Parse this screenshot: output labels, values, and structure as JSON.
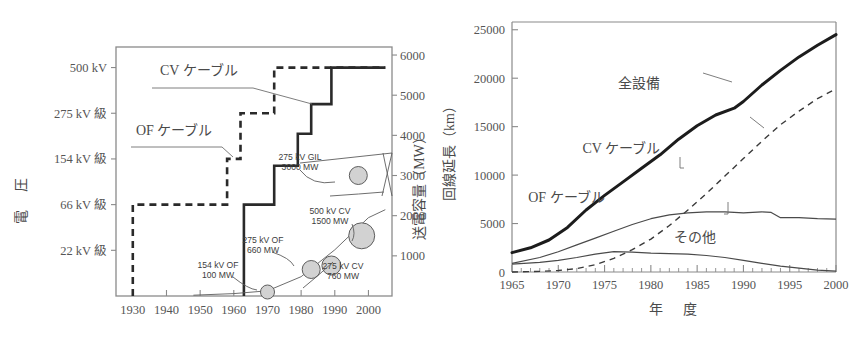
{
  "figure": {
    "background": "#ffffff",
    "ink": "#2a2a2a",
    "bubble_fill": "#d2d2d2",
    "bubble_stroke": "#5d5d5d",
    "caption_fragment": ""
  },
  "chart_data": [
    {
      "id": "left",
      "type": "line",
      "title": "",
      "xlabel": "",
      "ylabel": "電　圧",
      "y2label": "送電容量（MW）",
      "xlim": [
        1925,
        2007
      ],
      "xticks": [
        1930,
        1940,
        1950,
        1960,
        1970,
        1980,
        1990,
        2000
      ],
      "xticklabels": [
        "1930",
        "1940",
        "1950",
        "1960",
        "1970",
        "1980",
        "1990",
        "2000"
      ],
      "y_category_ticks": [
        {
          "label": "22 kV 級",
          "value": 1
        },
        {
          "label": "66 kV 級",
          "value": 2
        },
        {
          "label": "154 kV 級",
          "value": 3
        },
        {
          "label": "275 kV 級",
          "value": 4
        },
        {
          "label": "500 kV",
          "value": 5
        }
      ],
      "ylim": [
        0,
        5.45
      ],
      "y2ticks": [
        1000,
        2000,
        3000,
        4000,
        5000,
        6000
      ],
      "y2ticklabels": [
        "1000",
        "2000",
        "3000",
        "4000",
        "5000",
        "6000"
      ],
      "y2lim": [
        0,
        6200
      ],
      "grid": false,
      "series": [
        {
          "name": "OF ケーブル",
          "style": "dashed",
          "label_text": "OF ケーブル",
          "steps": [
            {
              "year": 1930,
              "level": 0
            },
            {
              "year": 1930,
              "level": 2
            },
            {
              "year": 1958,
              "level": 2
            },
            {
              "year": 1958,
              "level": 3
            },
            {
              "year": 1962,
              "level": 3
            },
            {
              "year": 1962,
              "level": 4
            },
            {
              "year": 1972,
              "level": 4
            },
            {
              "year": 1972,
              "level": 5
            },
            {
              "year": 2005,
              "level": 5
            }
          ]
        },
        {
          "name": "CV ケーブル",
          "style": "solid",
          "label_text": "CV ケーブル",
          "steps": [
            {
              "year": 1963,
              "level": 0
            },
            {
              "year": 1963,
              "level": 2
            },
            {
              "year": 1972,
              "level": 2
            },
            {
              "year": 1972,
              "level": 2.85
            },
            {
              "year": 1979,
              "level": 2.85
            },
            {
              "year": 1979,
              "level": 3.55
            },
            {
              "year": 1983,
              "level": 3.55
            },
            {
              "year": 1983,
              "level": 4.2
            },
            {
              "year": 1989,
              "level": 4.2
            },
            {
              "year": 1989,
              "level": 5
            },
            {
              "year": 2005,
              "level": 5
            }
          ]
        }
      ],
      "capacity_curve": [
        {
          "year": 1948,
          "mw": 20
        },
        {
          "year": 1960,
          "mw": 60
        },
        {
          "year": 1970,
          "mw": 130
        },
        {
          "year": 1980,
          "mw": 480
        },
        {
          "year": 1990,
          "mw": 1150
        },
        {
          "year": 2000,
          "mw": 1950
        },
        {
          "year": 2005,
          "mw": 2150
        }
      ],
      "bubbles": [
        {
          "label": "154 kV OF\n100 MW",
          "label_lines": [
            "154 kV OF",
            "100 MW"
          ],
          "year": 1970,
          "mw": 100,
          "r": 7
        },
        {
          "label": "275 kV OF\n660 MW",
          "label_lines": [
            "275 kV OF",
            "660 MW"
          ],
          "year": 1983,
          "mw": 660,
          "r": 9
        },
        {
          "label": "275 kV CV\n760 MW",
          "label_lines": [
            "275 kV CV",
            "760 MW"
          ],
          "year": 1989,
          "mw": 760,
          "r": 9.5
        },
        {
          "label": "500 kV CV\n1500 MW",
          "label_lines": [
            "500 kV CV",
            "1500 MW"
          ],
          "year": 1998,
          "mw": 1500,
          "r": 13
        },
        {
          "label": "275 kV GIL\n3000 MW",
          "label_lines": [
            "275 kV GIL",
            "3000 MW"
          ],
          "year": 1997,
          "mw": 3000,
          "r": 9
        }
      ]
    },
    {
      "id": "right",
      "type": "line",
      "title": "",
      "xlabel": "年　度",
      "ylabel": "回線延長（km）",
      "xlim": [
        1965,
        2000
      ],
      "xticks": [
        1965,
        1970,
        1975,
        1980,
        1985,
        1990,
        1995,
        2000
      ],
      "xticklabels": [
        "1965",
        "1970",
        "1975",
        "1980",
        "1985",
        "1990",
        "1995",
        "2000"
      ],
      "yticks": [
        0,
        5000,
        10000,
        15000,
        20000,
        25000
      ],
      "yticklabels": [
        "0",
        "5000",
        "10000",
        "15000",
        "20000",
        "25000"
      ],
      "ylim": [
        0,
        25800
      ],
      "grid": false,
      "series": [
        {
          "name": "全設備",
          "style": "thick-solid",
          "x": [
            1965,
            1967,
            1969,
            1971,
            1973,
            1975,
            1977,
            1979,
            1981,
            1983,
            1985,
            1987,
            1989,
            1990,
            1992,
            1994,
            1996,
            1998,
            2000
          ],
          "values": [
            2000,
            2500,
            3300,
            4600,
            6400,
            7900,
            9300,
            10700,
            12100,
            13700,
            15100,
            16200,
            16900,
            17600,
            19300,
            20800,
            22200,
            23400,
            24500
          ]
        },
        {
          "name": "CV ケーブル",
          "style": "dashed",
          "x": [
            1965,
            1968,
            1970,
            1972,
            1974,
            1976,
            1978,
            1980,
            1982,
            1984,
            1986,
            1988,
            1990,
            1992,
            1994,
            1996,
            1998,
            2000
          ],
          "values": [
            0,
            60,
            150,
            350,
            750,
            1400,
            2300,
            3400,
            4800,
            6400,
            8100,
            9900,
            11700,
            13500,
            15200,
            16600,
            17900,
            18900
          ]
        },
        {
          "name": "OF ケーブル",
          "style": "thin-solid",
          "x": [
            1965,
            1968,
            1970,
            1972,
            1974,
            1976,
            1978,
            1980,
            1982,
            1984,
            1986,
            1988,
            1990,
            1992,
            1993,
            1994,
            1996,
            1998,
            2000
          ],
          "values": [
            900,
            1500,
            2100,
            2800,
            3500,
            4200,
            4900,
            5500,
            5900,
            6100,
            6200,
            6200,
            6100,
            6200,
            6150,
            5600,
            5600,
            5500,
            5450
          ]
        },
        {
          "name": "その他",
          "style": "thin-solid",
          "x": [
            1965,
            1968,
            1970,
            1972,
            1974,
            1976,
            1978,
            1980,
            1982,
            1984,
            1986,
            1988,
            1990,
            1992,
            1994,
            1996,
            1998,
            2000
          ],
          "values": [
            800,
            1000,
            1200,
            1500,
            1850,
            2100,
            2050,
            1950,
            1900,
            1850,
            1700,
            1500,
            1200,
            900,
            600,
            400,
            200,
            80
          ]
        }
      ],
      "annotations": [
        {
          "text": "全設備",
          "x": 1981,
          "y": 19000
        },
        {
          "text": "CV ケーブル",
          "x": 1981,
          "y": 12300
        },
        {
          "text": "OF ケーブル",
          "x": 1975,
          "y": 7200
        },
        {
          "text": "その他",
          "x": 1987,
          "y": 3100
        }
      ]
    }
  ]
}
